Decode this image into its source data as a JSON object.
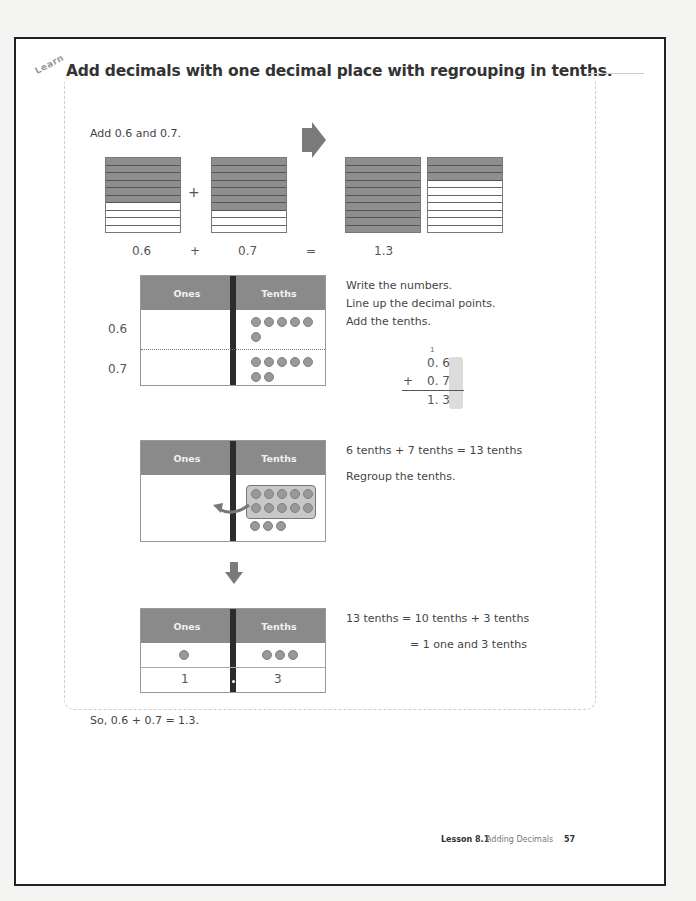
{
  "lesson": {
    "tag": "Learn",
    "title": "Add decimals with one decimal place with regrouping in tenths.",
    "intro": "Add 0.6 and 0.7."
  },
  "model": {
    "grids": [
      {
        "label": "0.6",
        "filled_rows": 6,
        "total_rows": 10
      },
      {
        "label": "0.7",
        "filled_rows": 7,
        "total_rows": 10
      },
      {
        "label": "1.0",
        "filled_rows": 10,
        "total_rows": 10
      },
      {
        "label": "0.3",
        "filled_rows": 3,
        "total_rows": 10
      }
    ],
    "equation": {
      "left": "0.6",
      "plus": "+",
      "right": "0.7",
      "equals": "=",
      "result": "1.3"
    }
  },
  "step1": {
    "chart": {
      "col1": "Ones",
      "col2": "Tenths",
      "row_labels": [
        "0.6",
        "0.7"
      ],
      "tenths_counters": [
        6,
        7
      ]
    },
    "instructions": [
      "Write the numbers.",
      "Line up the decimal points.",
      "Add the tenths."
    ],
    "vertical": {
      "carry": "1",
      "line1": "0. 6",
      "op": "+",
      "line2": "0. 7",
      "result": "1. 3"
    }
  },
  "step2": {
    "chart": {
      "col1": "Ones",
      "col2": "Tenths",
      "grouped_counters": 10,
      "loose_counters": 3
    },
    "equation": "6 tenths  +  7 tenths  =  13 tenths",
    "instruction": "Regroup the tenths."
  },
  "step3": {
    "chart": {
      "col1": "Ones",
      "col2": "Tenths",
      "ones_counters": 1,
      "tenths_counters": 3,
      "ones_value": "1",
      "tenths_value": "3"
    },
    "line1": "13 tenths  =  10 tenths  +  3 tenths",
    "line2": "=  1 one and 3 tenths"
  },
  "conclusion": "So, 0.6  +  0.7  =  1.3.",
  "footer": {
    "lesson_label": "Lesson 8.1",
    "lesson_title": "Adding Decimals",
    "page_number": "57"
  },
  "colors": {
    "shade": "#8e8e8e",
    "header": "#8a8a8a",
    "divider": "#2c2c2c",
    "counter": "#999999"
  }
}
